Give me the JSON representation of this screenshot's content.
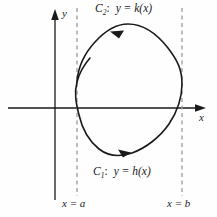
{
  "figure": {
    "background_color": "#fefefe",
    "ink_color": "#1a1a1a",
    "dash_color": "#9a9a9a",
    "axes": {
      "x_label": "x",
      "y_label": "y",
      "origin_px": [
        55,
        108
      ]
    },
    "curves": {
      "upper": {
        "name": "C",
        "subscript": "2",
        "separator": ":",
        "equation": "y = k(x)",
        "direction": "leftward",
        "arrow_label": "left-arrowhead"
      },
      "lower": {
        "name": "C",
        "subscript": "1",
        "separator": ":",
        "equation": "y = h(x)",
        "direction": "rightward",
        "arrow_label": "right-arrowhead"
      }
    },
    "boundaries": {
      "left": {
        "label": "x = a",
        "x_px": 77
      },
      "right": {
        "label": "x = b",
        "x_px": 182
      }
    }
  }
}
